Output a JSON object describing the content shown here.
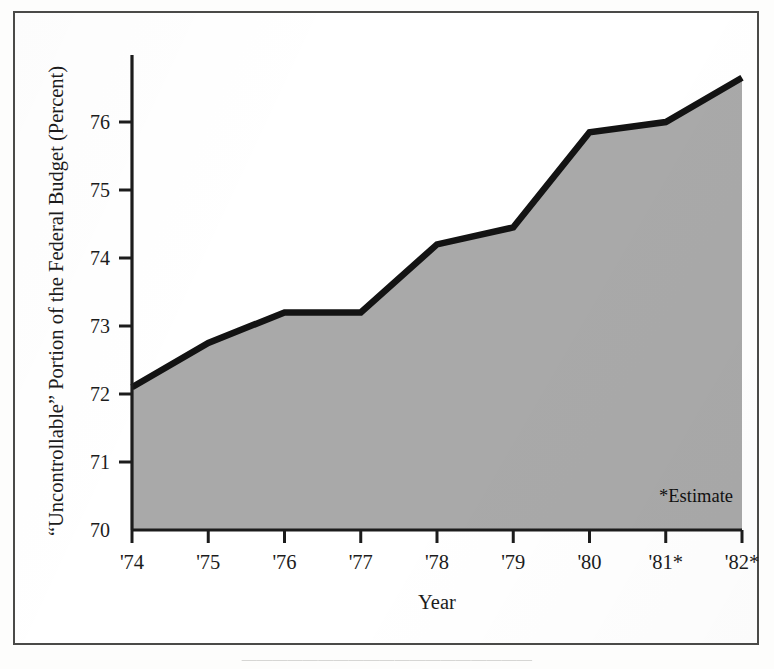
{
  "figure": {
    "background_color": "#ffffff",
    "frame_color": "#4a4a48",
    "caption_cutoff_text": "———————————————————"
  },
  "annotation": {
    "estimate_note": "*Estimate"
  },
  "chart_data": {
    "type": "area",
    "title": "",
    "subtitle": "",
    "xlabel": "Year",
    "ylabel": "“Uncontrollable” Portion of the Federal Budget (Percent)",
    "categories": [
      "'74",
      "'75",
      "'76",
      "'77",
      "'78",
      "'79",
      "'80",
      "'81*",
      "'82*"
    ],
    "x_tick_labels": [
      "'74",
      "'75",
      "'76",
      "'77",
      "'78",
      "'79",
      "'80",
      "'81*",
      "'82*"
    ],
    "y_tick_labels": [
      "70",
      "71",
      "72",
      "73",
      "74",
      "75",
      "76"
    ],
    "y_ticks": [
      70,
      71,
      72,
      73,
      74,
      75,
      76
    ],
    "values": [
      72.1,
      72.75,
      73.2,
      73.2,
      74.2,
      74.45,
      75.85,
      76.0,
      76.65
    ],
    "series": [
      {
        "name": "“Uncontrollable” Portion of the Federal Budget",
        "values": [
          72.1,
          72.75,
          73.2,
          73.2,
          74.2,
          74.45,
          75.85,
          76.0,
          76.65
        ]
      }
    ],
    "ylim": [
      70,
      77
    ],
    "xlim": [
      "'74",
      "'82*"
    ],
    "grid": false,
    "legend": "none",
    "area_fill_color": "#a8a8a8",
    "line_color": "#111111",
    "axis_color": "#1c1c1c",
    "annotations": [
      "*Estimate"
    ]
  }
}
